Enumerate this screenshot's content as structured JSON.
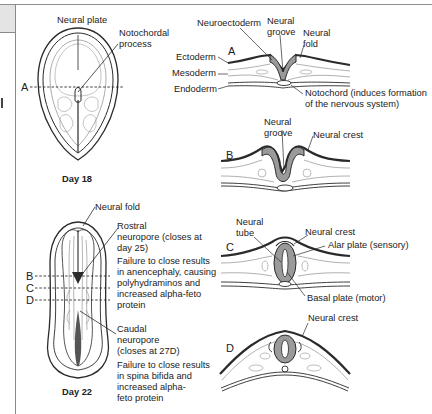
{
  "figure": {
    "day18": {
      "caption": "Day 18",
      "labels": {
        "neural_plate": "Neural plate",
        "notochordal_process_1": "Notochordal",
        "notochordal_process_2": "process",
        "section_a": "A"
      }
    },
    "day22": {
      "caption": "Day 22",
      "labels": {
        "neural_fold": "Neural fold",
        "rostral_1": "Rostral",
        "rostral_2": "neuropore (closes at",
        "rostral_3": "day 25)",
        "rostral_fail_1": "Failure to close results",
        "rostral_fail_2": "in anencephaly, causing",
        "rostral_fail_3": "polyhydraminos and",
        "rostral_fail_4": "increased alpha-feto",
        "rostral_fail_5": "protein",
        "caudal_1": "Caudal",
        "caudal_2": "neuropore",
        "caudal_3": "(closes at 27D)",
        "caudal_fail_1": "Failure to close results",
        "caudal_fail_2": "in spina bifida and",
        "caudal_fail_3": "increased alpha-",
        "caudal_fail_4": "feto protein",
        "section_b": "B",
        "section_c": "C",
        "section_d": "D"
      }
    },
    "section_a": {
      "letter": "A",
      "neuroectoderm": "Neuroectoderm",
      "neural_groove_1": "Neural",
      "neural_groove_2": "groove",
      "neural_fold_1": "Neural",
      "neural_fold_2": "fold",
      "ectoderm": "Ectoderm",
      "mesoderm": "Mesoderm",
      "endoderm": "Endoderm",
      "notochord_1": "Notochord (induces formation",
      "notochord_2": "of the nervous system)"
    },
    "section_b": {
      "letter": "B",
      "neural_groove_1": "Neural",
      "neural_groove_2": "groove",
      "neural_crest": "Neural crest"
    },
    "section_c": {
      "letter": "C",
      "neural_tube_1": "Neural",
      "neural_tube_2": "tube",
      "neural_crest": "Neural crest",
      "alar_plate": "Alar plate (sensory)",
      "basal_plate": "Basal plate (motor)"
    },
    "section_d": {
      "letter": "D",
      "neural_crest": "Neural crest"
    }
  },
  "colors": {
    "neural_tissue_fill": "#9a9a9a",
    "line": "#2a2a2a",
    "faint_line": "#8a8a8a",
    "border": "#8a8a8a",
    "side_box": "#e4e4e4"
  }
}
